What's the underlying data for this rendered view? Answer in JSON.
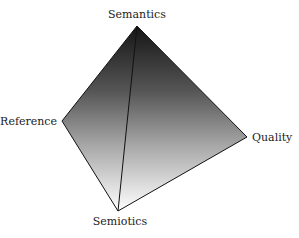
{
  "diagram": {
    "type": "tetrahedron",
    "vertices": [
      {
        "id": "semantics",
        "label": "Semantics",
        "x": 137,
        "y": 26
      },
      {
        "id": "reference",
        "label": "Reference",
        "x": 62,
        "y": 121
      },
      {
        "id": "quality",
        "label": "Quality",
        "x": 247,
        "y": 137
      },
      {
        "id": "semiotics",
        "label": "Semiotics",
        "x": 118,
        "y": 211
      }
    ],
    "edges": [
      [
        "semantics",
        "reference"
      ],
      [
        "semantics",
        "quality"
      ],
      [
        "semantics",
        "semiotics"
      ],
      [
        "reference",
        "semiotics"
      ],
      [
        "quality",
        "semiotics"
      ]
    ],
    "colors": {
      "gradient_top": "#151515",
      "gradient_bottom": "#ffffff",
      "edge": "#111111",
      "text": "#222222"
    }
  }
}
